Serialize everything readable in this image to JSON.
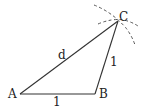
{
  "diagram": {
    "points": {
      "A": {
        "label": "A",
        "x": 20,
        "y": 94
      },
      "B": {
        "label": "B",
        "x": 95,
        "y": 94
      },
      "C": {
        "label": "C",
        "x": 118,
        "y": 21
      }
    },
    "edges": [
      {
        "from": "A",
        "to": "B",
        "label": "1"
      },
      {
        "from": "B",
        "to": "C",
        "label": "1"
      },
      {
        "from": "A",
        "to": "C",
        "label": "d"
      }
    ],
    "arcs": [
      {
        "center": "A",
        "through": "C",
        "style": "dashed"
      },
      {
        "center": "B",
        "through": "C",
        "style": "dashed"
      }
    ],
    "colors": {
      "line": "#333333",
      "dash": "#555555"
    }
  }
}
